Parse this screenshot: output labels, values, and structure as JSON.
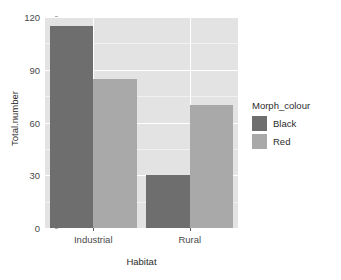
{
  "chart_data": {
    "type": "bar",
    "title": "",
    "xlabel": "Habitat",
    "ylabel": "Total.number",
    "categories": [
      "Industrial",
      "Rural"
    ],
    "series": [
      {
        "name": "Black",
        "values": [
          115,
          30
        ],
        "color": "#6e6e6e"
      },
      {
        "name": "Red",
        "values": [
          85,
          70
        ],
        "color": "#a9a9a9"
      }
    ],
    "ylim": [
      0,
      120
    ],
    "yticks": [
      0,
      30,
      60,
      90,
      120
    ],
    "ytick_labels": [
      "0",
      "30",
      "60",
      "90",
      "120"
    ],
    "grid": true,
    "legend_position": "right",
    "legend_title": "Morph_colour",
    "panel_background": "#e3e3e3",
    "grid_color": "#ffffff"
  },
  "axes": {
    "y_title": "Total.number",
    "x_title": "Habitat"
  },
  "legend": {
    "title": "Morph_colour",
    "entries": [
      {
        "label": "Black",
        "color": "#6e6e6e"
      },
      {
        "label": "Red",
        "color": "#a9a9a9"
      }
    ]
  }
}
